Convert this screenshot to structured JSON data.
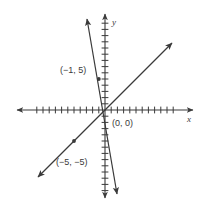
{
  "figure": {
    "title": "",
    "background_color": "#ffffff",
    "ink_color": "#3a3a3a"
  },
  "axes": {
    "x_label": "x",
    "y_label": "y",
    "origin_label": "(0, 0)",
    "x_axis_name": "x-axis",
    "y_axis_name": "y-axis",
    "ticks_per_side_x": 11,
    "ticks_per_side_y": 9,
    "tick_spacing_px": 6.2,
    "origin_px": [
      105,
      110
    ],
    "arrowheads": true,
    "grid": false
  },
  "chart_data": {
    "type": "line",
    "title": "",
    "xlabel": "x",
    "ylabel": "y",
    "xlim": [
      -14,
      14
    ],
    "ylim": [
      -14,
      14
    ],
    "grid": false,
    "legend": "none",
    "series": [
      {
        "name": "steep-line",
        "slope": -5,
        "intercept": 0,
        "equation": "y = -5x",
        "points": [
          {
            "label": "(−1, 5)",
            "x": -1,
            "y": 5
          },
          {
            "label": "(0, 0)",
            "x": 0,
            "y": 0
          }
        ],
        "x_endpoints": [
          -1.85,
          1.55
        ],
        "arrow_both_ends": true
      },
      {
        "name": "shallow-line",
        "slope": 1,
        "intercept": 0,
        "equation": "y = x",
        "points": [
          {
            "label": "(−5, −5)",
            "x": -5,
            "y": -5
          },
          {
            "label": "(0, 0)",
            "x": 0,
            "y": 0
          }
        ],
        "x_endpoints": [
          -10.8,
          10.8
        ],
        "arrow_both_ends": true
      }
    ],
    "annotations": [
      {
        "name": "label-neg1-5",
        "text": "(−1, 5)",
        "x": -1,
        "y": 5
      },
      {
        "name": "label-origin",
        "text": "(0, 0)",
        "x": 0,
        "y": 0
      },
      {
        "name": "label-neg5-neg5",
        "text": "(−5, −5)",
        "x": -5,
        "y": -5
      }
    ],
    "markers": [
      {
        "name": "point-neg1-5",
        "x": -1,
        "y": 5
      },
      {
        "name": "point-neg5-neg5",
        "x": -5,
        "y": -5
      }
    ]
  }
}
